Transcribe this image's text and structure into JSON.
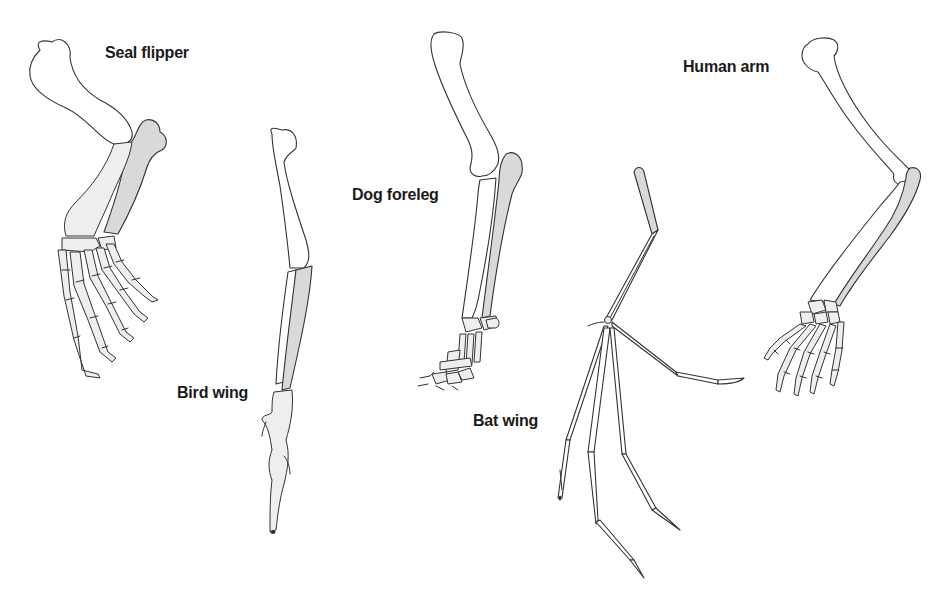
{
  "figure": {
    "colors": {
      "background": "#ffffff",
      "bone_fill": "#ffffff",
      "shaded_bone_fill": "#d9d9d9",
      "outline": "#333333",
      "label_text": "#1a1a1a"
    },
    "limbs": [
      {
        "id": "seal",
        "label": "Seal flipper"
      },
      {
        "id": "bird",
        "label": "Bird wing"
      },
      {
        "id": "dog",
        "label": "Dog foreleg"
      },
      {
        "id": "bat",
        "label": "Bat wing"
      },
      {
        "id": "human",
        "label": "Human arm"
      }
    ]
  }
}
